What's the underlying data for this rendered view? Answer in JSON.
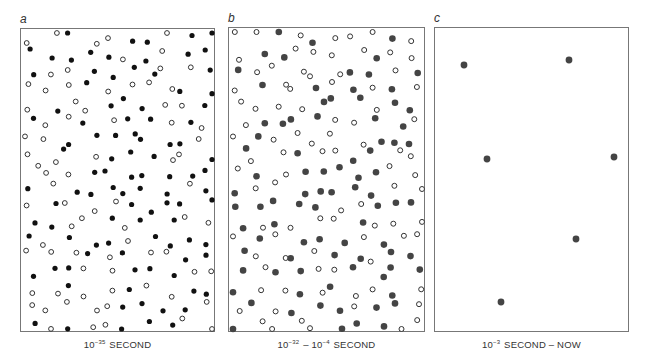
{
  "panels": [
    {
      "id": "a",
      "letter": "a",
      "caption_base": "10",
      "caption_exp": "−35",
      "caption_rest": " SECOND",
      "box": {
        "x": 20,
        "y": 28,
        "w": 195,
        "h": 304
      },
      "grid": {
        "cols": 10,
        "rows": 18
      },
      "filled_fraction": 0.5,
      "filled_color": "#111111",
      "filled_radius": 2.6,
      "open_radius": 2.9,
      "seed": 7
    },
    {
      "id": "b",
      "letter": "b",
      "caption_base": "10",
      "caption_exp": "−32",
      "caption_mid": " – 10",
      "caption_exp2": "−4",
      "caption_rest": " SECOND",
      "box": {
        "x": 228,
        "y": 27,
        "w": 197,
        "h": 305
      },
      "grid": {
        "cols": 10,
        "rows": 18
      },
      "filled_fraction": 0.5,
      "filled_color": "#444444",
      "filled_radius": 3.3,
      "open_radius": 3.0,
      "seed": 19
    },
    {
      "id": "c",
      "letter": "c",
      "caption_base": "10",
      "caption_exp": "−3",
      "caption_rest": " SECOND – NOW",
      "box": {
        "x": 434,
        "y": 27,
        "w": 195,
        "h": 305
      },
      "filled_color": "#444444",
      "filled_radius": 3.4,
      "dots": [
        {
          "x": 463,
          "y": 64
        },
        {
          "x": 568,
          "y": 59
        },
        {
          "x": 486,
          "y": 158
        },
        {
          "x": 613,
          "y": 156
        },
        {
          "x": 575,
          "y": 238
        },
        {
          "x": 500,
          "y": 301
        }
      ]
    }
  ]
}
